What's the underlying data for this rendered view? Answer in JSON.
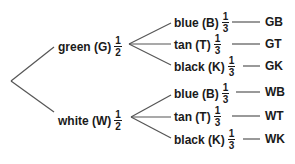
{
  "diagram": {
    "type": "probability-tree",
    "line_color": "#555555",
    "text_color": "#1a1a1a",
    "first_level": [
      {
        "label": "green (G)",
        "prob_num": "1",
        "prob_den": "2",
        "second_level": [
          {
            "label": "blue (B)",
            "prob_num": "1",
            "prob_den": "3",
            "outcome": "GB"
          },
          {
            "label": "tan (T)",
            "prob_num": "1",
            "prob_den": "3",
            "outcome": "GT"
          },
          {
            "label": "black (K)",
            "prob_num": "1",
            "prob_den": "3",
            "outcome": "GK"
          }
        ]
      },
      {
        "label": "white (W)",
        "prob_num": "1",
        "prob_den": "2",
        "second_level": [
          {
            "label": "blue (B)",
            "prob_num": "1",
            "prob_den": "3",
            "outcome": "WB"
          },
          {
            "label": "tan (T)",
            "prob_num": "1",
            "prob_den": "3",
            "outcome": "WT"
          },
          {
            "label": "black (K)",
            "prob_num": "1",
            "prob_den": "3",
            "outcome": "WK"
          }
        ]
      }
    ]
  }
}
